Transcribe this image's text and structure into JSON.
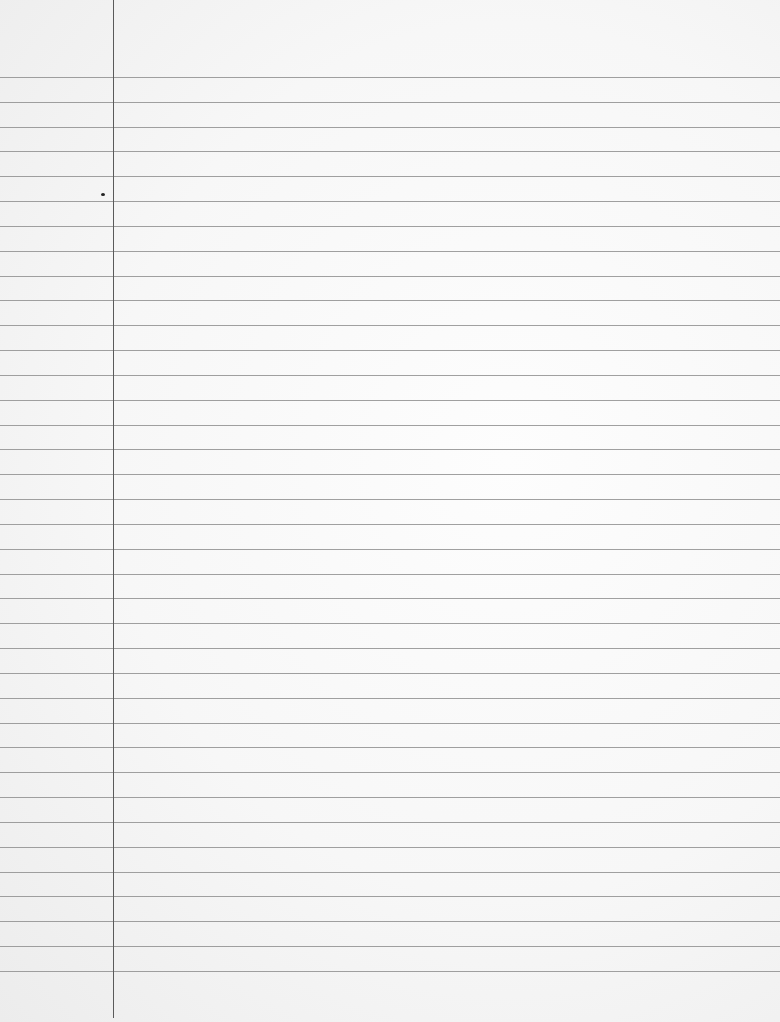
{
  "sheet": {
    "type": "lined-paper",
    "background_color": "#f7f7f7",
    "rule_color": "#8f8f8f",
    "margin_color": "#5a5a5a",
    "rules": {
      "count": 37,
      "first_y": 77,
      "spacing": 24.83
    },
    "margin_line": {
      "x": 113,
      "height": 1018
    },
    "ink_dot": {
      "x": 101,
      "y": 193
    }
  }
}
